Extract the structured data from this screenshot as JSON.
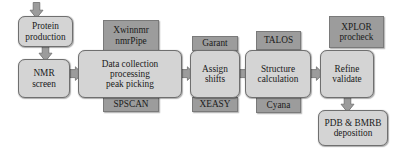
{
  "diagram": {
    "colors": {
      "step_fill": "#d4d4d4",
      "tag_fill": "#9c9c9c",
      "stroke": "#6f6f6f",
      "arrow_fill": "#9c9c9c",
      "background": "#ffffff"
    },
    "steps": [
      {
        "id": "protein-production",
        "line1": "Protein",
        "line2": "production"
      },
      {
        "id": "nmr-screen",
        "line1": "NMR",
        "line2": "screen"
      },
      {
        "id": "data-collection",
        "line1": "Data collection",
        "line2": "processing",
        "line3": "peak picking"
      },
      {
        "id": "assign-shifts",
        "line1": "Assign",
        "line2": "shifts"
      },
      {
        "id": "structure-calculation",
        "line1": "Structure",
        "line2": "calculation"
      },
      {
        "id": "refine-validate",
        "line1": "Refine",
        "line2": "validate"
      },
      {
        "id": "pdb-bmrb-deposition",
        "line1": "PDB & BMRB",
        "line2": "deposition"
      }
    ],
    "software_tags": [
      {
        "id": "xwinnmr-nmrpipe",
        "line1": "Xwinnmr",
        "line2": "nmrPipe",
        "position": "above",
        "attached_to": "data-collection"
      },
      {
        "id": "spscan",
        "line1": "SPSCAN",
        "line2": "",
        "position": "below",
        "attached_to": "data-collection"
      },
      {
        "id": "garant",
        "line1": "Garant",
        "line2": "",
        "position": "above",
        "attached_to": "assign-shifts"
      },
      {
        "id": "xeasy",
        "line1": "XEASY",
        "line2": "",
        "position": "below",
        "attached_to": "assign-shifts"
      },
      {
        "id": "talos",
        "line1": "TALOS",
        "line2": "",
        "position": "above",
        "attached_to": "structure-calculation"
      },
      {
        "id": "cyana",
        "line1": "Cyana",
        "line2": "",
        "position": "below",
        "attached_to": "structure-calculation"
      },
      {
        "id": "xplor-procheck",
        "line1": "XPLOR",
        "line2": "procheck",
        "position": "above",
        "attached_to": "refine-validate"
      }
    ],
    "arrows": [
      {
        "id": "arrow-into-protein-production",
        "direction": "down",
        "from": "",
        "to": "protein-production"
      },
      {
        "id": "arrow-protein-to-nmr",
        "direction": "down",
        "from": "protein-production",
        "to": "nmr-screen"
      },
      {
        "id": "arrow-nmr-to-data",
        "direction": "right",
        "from": "nmr-screen",
        "to": "data-collection"
      },
      {
        "id": "arrow-data-to-assign",
        "direction": "right",
        "from": "data-collection",
        "to": "assign-shifts"
      },
      {
        "id": "arrow-assign-to-structure",
        "direction": "right",
        "from": "assign-shifts",
        "to": "structure-calculation"
      },
      {
        "id": "arrow-structure-to-refine",
        "direction": "right",
        "from": "structure-calculation",
        "to": "refine-validate"
      },
      {
        "id": "arrow-refine-to-deposition",
        "direction": "down",
        "from": "refine-validate",
        "to": "pdb-bmrb-deposition"
      }
    ]
  }
}
